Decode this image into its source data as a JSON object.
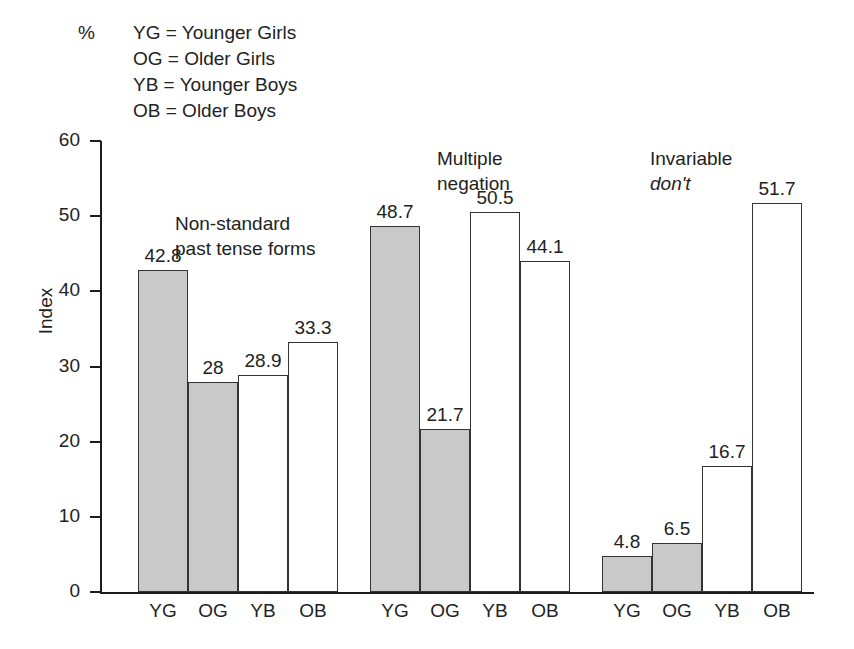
{
  "chart_data": {
    "type": "bar",
    "title": "",
    "xlabel": "",
    "ylabel": "Index",
    "unit_label": "%",
    "ylim": [
      0,
      60
    ],
    "ytick_values": [
      60,
      50,
      40,
      30,
      20,
      10,
      0
    ],
    "ytick_labels": [
      "60",
      "50",
      "40",
      "30",
      "20",
      "10",
      "0"
    ],
    "grid": false,
    "legend_position": "top-left",
    "legend_entries": [
      "YG = Younger Girls",
      "OG = Older Girls",
      "YB = Younger Boys",
      "OB = Older Boys"
    ],
    "categories": [
      "YG",
      "OG",
      "YB",
      "OB"
    ],
    "groups": [
      {
        "label_lines": [
          "Non-standard",
          "past tense forms"
        ],
        "label_italic_line": "",
        "values": [
          42.8,
          28,
          28.9,
          33.3
        ],
        "value_labels": [
          "42.8",
          "28",
          "28.9",
          "33.3"
        ],
        "fills": [
          "filled",
          "filled",
          "hollow",
          "hollow"
        ]
      },
      {
        "label_lines": [
          "Multiple",
          "negation"
        ],
        "label_italic_line": "",
        "values": [
          48.7,
          21.7,
          50.5,
          44.1
        ],
        "value_labels": [
          "48.7",
          "21.7",
          "50.5",
          "44.1"
        ],
        "fills": [
          "filled",
          "filled",
          "hollow",
          "hollow"
        ]
      },
      {
        "label_lines": [
          "Invariable"
        ],
        "label_italic_line": "don't",
        "values": [
          4.8,
          6.5,
          16.7,
          51.7
        ],
        "value_labels": [
          "4.8",
          "6.5",
          "16.7",
          "51.7"
        ],
        "fills": [
          "filled",
          "filled",
          "hollow",
          "hollow"
        ]
      }
    ],
    "colors": {
      "filled_bar": "#c9c9c9",
      "hollow_bar": "#ffffff",
      "bar_outline": "#333333",
      "axis": "#1c1c1c",
      "text": "#222222"
    }
  },
  "caption": {
    "text": ""
  }
}
